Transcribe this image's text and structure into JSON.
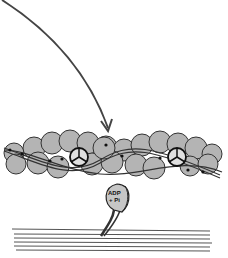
{
  "diagram": {
    "type": "actin-myosin cross-bridge",
    "colors": {
      "globule_fill": "#b4b4b4",
      "globule_stroke": "#333333",
      "arrow": "#444444",
      "background": "#ffffff",
      "filament_lines": "#555555"
    },
    "labels": {
      "myosin_head_line1": "ADP",
      "myosin_head_line2": "+ Pi"
    },
    "elements": [
      {
        "name": "curved-arrow",
        "description": "arrow pointing down onto actin filament"
      },
      {
        "name": "actin-filament",
        "description": "double strand of gray globular actin monomers with tropomyosin strands"
      },
      {
        "name": "troponin-complex",
        "count": 2
      },
      {
        "name": "myosin-head",
        "bound_nucleotide": "ADP + Pi"
      },
      {
        "name": "thick-filament",
        "description": "bundle of myosin tail lines"
      }
    ]
  }
}
